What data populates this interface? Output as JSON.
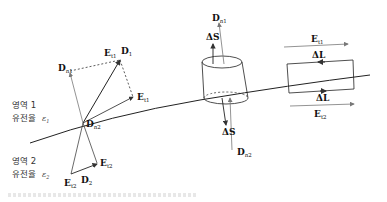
{
  "diagram": {
    "type": "boundary-conditions-dielectric-interface",
    "regions": [
      {
        "label": "영역 1",
        "medium": "유전율",
        "epsilon": "ε",
        "epsilon_sub": "1"
      },
      {
        "label": "영역 2",
        "medium": "유전율",
        "epsilon": "ε",
        "epsilon_sub": "2"
      }
    ],
    "vectors": {
      "D1": {
        "main": "D",
        "sub": "1"
      },
      "Et1": {
        "main": "E",
        "sub": "t1"
      },
      "Dn1": {
        "main": "D",
        "sub": "n1"
      },
      "Et1_b": {
        "main": "E",
        "sub": "t1"
      },
      "Dn2": {
        "main": "D",
        "sub": "n2"
      },
      "Et2": {
        "main": "E",
        "sub": "t2"
      },
      "D2": {
        "main": "D",
        "sub": "2"
      },
      "Et2_b": {
        "main": "E",
        "sub": "t2"
      }
    },
    "pillbox": {
      "dn1": {
        "main": "D",
        "sub": "n1"
      },
      "ds_top": "ΔS",
      "ds_bottom": "ΔS",
      "dn2": {
        "main": "D",
        "sub": "n2"
      }
    },
    "loop": {
      "et1": {
        "main": "E",
        "sub": "t1"
      },
      "dl_top": "ΔL",
      "dl_bottom": "ΔL",
      "et2": {
        "main": "E",
        "sub": "t2"
      }
    },
    "colors": {
      "line": "#222222",
      "arrow": "#555555",
      "text": "#111111"
    }
  }
}
